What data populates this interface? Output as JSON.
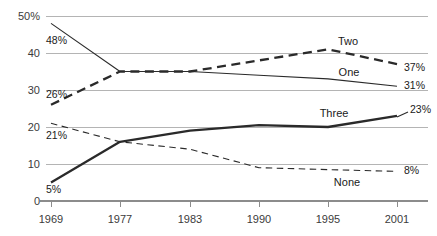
{
  "chart_data": {
    "type": "line",
    "title": "",
    "subtitle": "",
    "xlabel": "",
    "ylabel": "",
    "x": [
      "1969",
      "1977",
      "1983",
      "1990",
      "1995",
      "2001"
    ],
    "categories": [
      "1969",
      "1977",
      "1983",
      "1990",
      "1995",
      "2001"
    ],
    "ylim": [
      0,
      50
    ],
    "yticks": [
      0,
      10,
      20,
      30,
      40,
      50
    ],
    "ytick_labels": [
      "0",
      "10",
      "20",
      "30",
      "40",
      "50%"
    ],
    "grid": true,
    "legend": "inline-labels",
    "series": [
      {
        "name": "One",
        "style": "solid-thin",
        "values": [
          48,
          35,
          35,
          34,
          33,
          31
        ],
        "start_label": "48%",
        "end_label": "31%",
        "label_x": "1995",
        "label_y": 35
      },
      {
        "name": "Two",
        "style": "dashed-bold",
        "values": [
          26,
          35,
          35,
          38,
          41,
          37
        ],
        "start_label": "26%",
        "end_label": "37%",
        "label_x": "1995",
        "label_y": 44
      },
      {
        "name": "Three",
        "style": "solid-bold",
        "values": [
          5,
          16,
          19,
          20.5,
          20,
          23
        ],
        "start_label": "5%",
        "end_label": "23%",
        "label_x": "1995",
        "label_y": 24
      },
      {
        "name": "None",
        "style": "dashed-thin",
        "values": [
          21,
          16,
          14,
          9,
          8.5,
          8
        ],
        "start_label": "21%",
        "end_label": "8%",
        "label_x": "1995",
        "label_y": 5
      }
    ]
  },
  "axis": {
    "y": {
      "t50": "50%",
      "t40": "40",
      "t30": "30",
      "t20": "20",
      "t10": "10",
      "t0": "0"
    },
    "x": {
      "t1969": "1969",
      "t1977": "1977",
      "t1983": "1983",
      "t1990": "1990",
      "t1995": "1995",
      "t2001": "2001"
    }
  },
  "labels": {
    "one_name": "One",
    "two_name": "Two",
    "three_name": "Three",
    "none_name": "None",
    "one_start": "48%",
    "one_end": "31%",
    "two_start": "26%",
    "two_end": "37%",
    "three_start": "5%",
    "three_end": "23%",
    "none_start": "21%",
    "none_end": "8%"
  },
  "colors": {
    "line": "#2a2a2a",
    "grid": "#b4b4b4",
    "axis": "#8c8c8c",
    "text": "#1a1a1a",
    "tick_text": "#3b3b3b",
    "background": "#ffffff"
  }
}
